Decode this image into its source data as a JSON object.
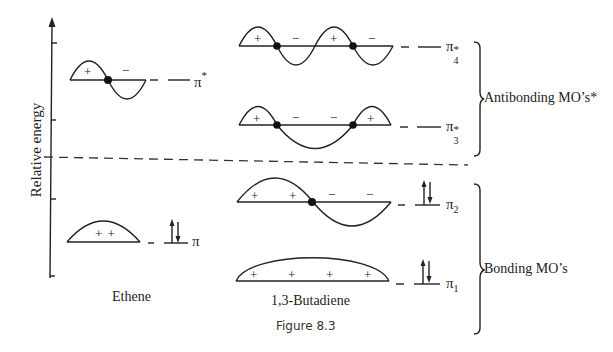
{
  "figure": {
    "caption": "Figure 8.3",
    "y_axis_label": "Relative energy",
    "divider": "dashed line separating antibonding (above) from bonding (below) levels"
  },
  "molecules": {
    "ethene": {
      "label": "Ethene",
      "orbitals": [
        {
          "name": "π*",
          "symbol": "π",
          "superscript": "*",
          "subscript": "",
          "phases": [
            "+",
            "−"
          ],
          "nodes": 1,
          "electrons": 0
        },
        {
          "name": "π",
          "symbol": "π",
          "superscript": "",
          "subscript": "",
          "phases": [
            "++"
          ],
          "nodes": 0,
          "electrons": 2
        }
      ]
    },
    "butadiene": {
      "label": "1,3-Butadiene",
      "orbitals": [
        {
          "name": "π4*",
          "symbol": "π",
          "superscript": "*",
          "subscript": "4",
          "phases": [
            "+",
            "−",
            "+",
            "−"
          ],
          "nodes": 3,
          "electrons": 0
        },
        {
          "name": "π3*",
          "symbol": "π",
          "superscript": "*",
          "subscript": "3",
          "phases": [
            "+",
            "−",
            "−",
            "+"
          ],
          "nodes": 2,
          "electrons": 0
        },
        {
          "name": "π2",
          "symbol": "π",
          "superscript": "",
          "subscript": "2",
          "phases": [
            "+",
            "+",
            "−",
            "−"
          ],
          "nodes": 1,
          "electrons": 2
        },
        {
          "name": "π1",
          "symbol": "π",
          "superscript": "",
          "subscript": "1",
          "phases": [
            "+",
            "+",
            "+",
            "+"
          ],
          "nodes": 0,
          "electrons": 2
        }
      ]
    }
  },
  "groups": {
    "antibonding": "Antibonding MO’s*",
    "bonding": "Bonding MO’s"
  },
  "glyphs": {
    "plus": "+",
    "minus": "−",
    "pi": "π",
    "star": "*",
    "sub1": "1",
    "sub2": "2",
    "sub3": "3",
    "sub4": "4",
    "plusplus": "+ +"
  },
  "colors": {
    "ink": "#222222",
    "background": "#ffffff"
  }
}
